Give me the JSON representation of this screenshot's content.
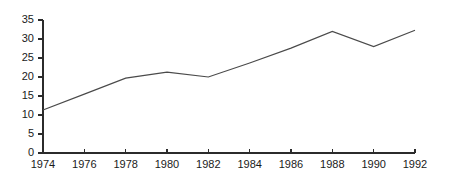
{
  "chart_data": {
    "type": "line",
    "title": "",
    "subtitle": "",
    "xlabel": "",
    "ylabel": "",
    "x": [
      1974,
      1976,
      1978,
      1980,
      1982,
      1984,
      1986,
      1988,
      1990,
      1992
    ],
    "values": [
      11.3,
      15.5,
      19.7,
      21.3,
      20.0,
      23.7,
      27.6,
      32.0,
      28.0,
      32.3
    ],
    "xtick_labels": [
      "1974",
      "1976",
      "1978",
      "1980",
      "1982",
      "1984",
      "1986",
      "1988",
      "1990",
      "1992"
    ],
    "ytick_labels": [
      "0",
      "5",
      "10",
      "15",
      "20",
      "25",
      "30",
      "35"
    ],
    "yticks": [
      0,
      5,
      10,
      15,
      20,
      25,
      30,
      35
    ],
    "xlim": [
      1974,
      1992
    ],
    "ylim": [
      0,
      35
    ],
    "grid": false,
    "legend": null,
    "legend_position": "none",
    "annotations": [],
    "series": [
      {
        "name": "series-1",
        "values": [
          11.3,
          15.5,
          19.7,
          21.3,
          20.0,
          23.7,
          27.6,
          32.0,
          28.0,
          32.3
        ]
      }
    ],
    "colors": {
      "line": "#4a4a4a",
      "axis": "#2b2b2b",
      "text": "#1a1a1a",
      "background": "#ffffff"
    }
  },
  "layout": {
    "plot_left": 43,
    "plot_right": 415,
    "plot_top": 20,
    "plot_bottom": 153,
    "tick_len_y": 5,
    "tick_len_x": 4,
    "ylabel_gap": 4,
    "xlabel_gap": 7
  }
}
